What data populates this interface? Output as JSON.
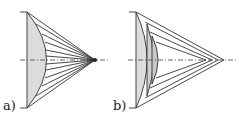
{
  "figure": {
    "panels": [
      {
        "label": "a)",
        "description": "single plano-convex lens with many rays converging to one focal point"
      },
      {
        "label": "b)",
        "description": "zoned (stepped) lens with rays converging to separate focal points"
      }
    ],
    "colors": {
      "line": "#333333",
      "fill": "#dcdcdc",
      "axis": "#555555"
    }
  }
}
